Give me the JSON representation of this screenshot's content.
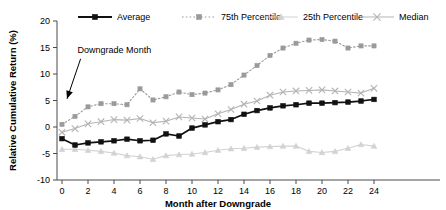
{
  "chart_data": {
    "type": "line",
    "title": "",
    "xlabel": "Month after Downgrade",
    "ylabel": "Relative Cumulative Return (%)",
    "xlim": [
      0,
      24
    ],
    "ylim": [
      -10,
      20
    ],
    "grid": false,
    "legend_position": "top",
    "x": [
      0,
      1,
      2,
      3,
      4,
      5,
      6,
      7,
      8,
      9,
      10,
      11,
      12,
      13,
      14,
      15,
      16,
      17,
      18,
      19,
      20,
      21,
      22,
      23,
      24
    ],
    "xticks": [
      0,
      2,
      4,
      6,
      8,
      10,
      12,
      14,
      16,
      18,
      20,
      22,
      24
    ],
    "xtick_labels": [
      "0",
      "2",
      "4",
      "6",
      "8",
      "10",
      "12",
      "14",
      "16",
      "18",
      "20",
      "22",
      "24"
    ],
    "yticks": [
      -10,
      -5,
      0,
      5,
      10,
      15,
      20
    ],
    "ytick_labels": [
      "-10",
      "-5",
      "0",
      "5",
      "10",
      "15",
      "20"
    ],
    "annotations": [
      {
        "text": "Downgrade Month",
        "x": 1.2,
        "y": 14.0,
        "arrow_to_x": 0.0,
        "arrow_to_y": 4.0
      }
    ],
    "series": [
      {
        "name": "Average",
        "color": "#111111",
        "marker": "square-filled",
        "linestyle": "solid",
        "values": [
          -2.2,
          -3.4,
          -3.0,
          -2.8,
          -2.6,
          -2.3,
          -2.6,
          -2.5,
          -1.3,
          -1.7,
          -0.2,
          0.4,
          1.0,
          1.4,
          2.4,
          3.1,
          3.6,
          4.0,
          4.2,
          4.5,
          4.5,
          4.6,
          4.7,
          4.9,
          5.2
        ]
      },
      {
        "name": "75th Percentile",
        "color": "#9a9a9a",
        "marker": "square-filled",
        "linestyle": "dotted",
        "values": [
          0.5,
          2.0,
          3.8,
          4.4,
          4.4,
          4.2,
          7.2,
          5.1,
          5.7,
          6.6,
          6.1,
          6.4,
          7.0,
          8.0,
          9.8,
          11.6,
          13.5,
          14.9,
          15.8,
          16.4,
          16.5,
          16.2,
          14.9,
          15.3,
          15.3
        ]
      },
      {
        "name": "25th Percentile",
        "color": "#d2d2d2",
        "marker": "triangle",
        "linestyle": "solid",
        "values": [
          -4.2,
          -4.2,
          -4.4,
          -4.6,
          -4.9,
          -5.4,
          -5.6,
          -6.1,
          -5.4,
          -5.2,
          -5.1,
          -4.8,
          -4.4,
          -4.1,
          -4.0,
          -3.8,
          -3.7,
          -3.6,
          -3.6,
          -4.6,
          -4.8,
          -4.6,
          -4.0,
          -3.3,
          -3.6
        ]
      },
      {
        "name": "Median",
        "color": "#b4b4b4",
        "marker": "x-cross",
        "linestyle": "solid",
        "values": [
          -1.0,
          -0.3,
          0.6,
          1.0,
          1.4,
          1.3,
          1.6,
          0.8,
          1.1,
          1.9,
          1.7,
          1.5,
          2.5,
          3.3,
          4.3,
          4.9,
          6.0,
          6.6,
          6.8,
          6.9,
          7.0,
          6.8,
          6.6,
          6.4,
          7.3
        ]
      }
    ]
  },
  "legend": {
    "items": [
      {
        "label": "Average"
      },
      {
        "label": "75th Percentile"
      },
      {
        "label": "25th Percentile"
      },
      {
        "label": "Median"
      }
    ]
  }
}
